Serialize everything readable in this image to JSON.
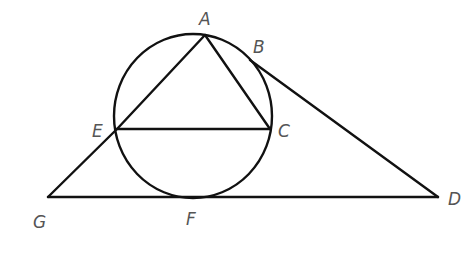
{
  "diagram": {
    "type": "geometry",
    "stroke_color": "#111111",
    "label_color": "#555555",
    "circle": {
      "cx": 193,
      "cy": 116,
      "rx": 79,
      "ry": 82
    },
    "points": {
      "A": {
        "label": "A",
        "x": 205,
        "y": 35,
        "lx": 199,
        "ly": 25
      },
      "B": {
        "label": "B",
        "x": 252,
        "y": 62,
        "lx": 253,
        "ly": 53
      },
      "C": {
        "label": "C",
        "x": 270,
        "y": 129,
        "lx": 278,
        "ly": 137
      },
      "E": {
        "label": "E",
        "x": 117,
        "y": 129,
        "lx": 92,
        "ly": 137
      },
      "F": {
        "label": "F",
        "x": 194,
        "y": 197,
        "lx": 186,
        "ly": 225
      },
      "G": {
        "label": "G",
        "x": 48,
        "y": 197,
        "lx": 33,
        "ly": 228
      },
      "D": {
        "label": "D",
        "x": 438,
        "y": 197,
        "lx": 448,
        "ly": 205
      }
    },
    "segments": [
      [
        "A",
        "E"
      ],
      [
        "A",
        "C"
      ],
      [
        "E",
        "C"
      ],
      [
        "B",
        "D"
      ],
      [
        "G",
        "D"
      ],
      [
        "G",
        "E"
      ]
    ]
  }
}
